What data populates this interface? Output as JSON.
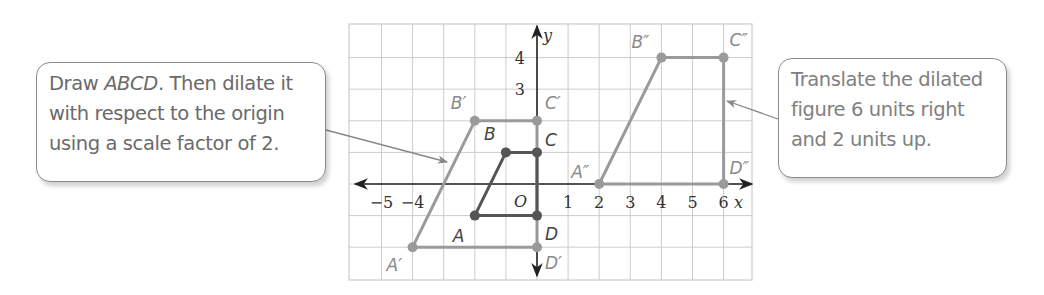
{
  "callouts": {
    "left": {
      "line1_pre": "Draw ",
      "line1_italic": "ABCD",
      "line1_post": ". Then dilate it",
      "line2": "with respect to the origin",
      "line3": "using a scale factor of 2."
    },
    "right": {
      "line1": "Translate the dilated",
      "line2": "figure 6 units right",
      "line3": "and 2 units up."
    }
  },
  "axes": {
    "x_label": "x",
    "y_label": "y",
    "origin_label": "O",
    "x_ticks": [
      "−5",
      "−4",
      "1",
      "2",
      "3",
      "4",
      "5",
      "6"
    ],
    "y_ticks": [
      "4",
      "3"
    ]
  },
  "colors": {
    "original": "#555555",
    "image": "#9a9a9a",
    "grid": "#cccccc",
    "axis": "#222222"
  },
  "chart_data": {
    "type": "coordinate-plane",
    "title": "",
    "xlim": [
      -6,
      7
    ],
    "ylim": [
      -3,
      5
    ],
    "grid": true,
    "figures": [
      {
        "name": "ABCD",
        "points": [
          {
            "label": "A",
            "x": -2,
            "y": -1
          },
          {
            "label": "B",
            "x": -1,
            "y": 1
          },
          {
            "label": "C",
            "x": 0,
            "y": 1
          },
          {
            "label": "D",
            "x": 0,
            "y": -1
          }
        ]
      },
      {
        "name": "A'B'C'D'",
        "points": [
          {
            "label": "A′",
            "x": -4,
            "y": -2
          },
          {
            "label": "B′",
            "x": -2,
            "y": 2
          },
          {
            "label": "C′",
            "x": 0,
            "y": 2
          },
          {
            "label": "D′",
            "x": 0,
            "y": -2
          }
        ]
      },
      {
        "name": "A''B''C''D''",
        "points": [
          {
            "label": "A″",
            "x": 2,
            "y": 0
          },
          {
            "label": "B″",
            "x": 4,
            "y": 4
          },
          {
            "label": "C″",
            "x": 6,
            "y": 4
          },
          {
            "label": "D″",
            "x": 6,
            "y": 0
          }
        ]
      }
    ]
  }
}
